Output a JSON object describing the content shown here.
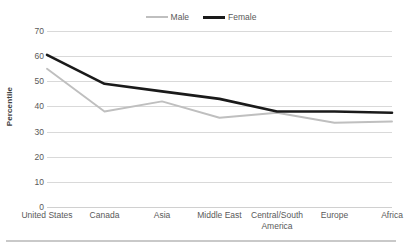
{
  "chart_data": {
    "type": "line",
    "title": "",
    "xlabel": "",
    "ylabel": "Percentile",
    "ylim": [
      0,
      70
    ],
    "yticks": [
      0,
      10,
      20,
      30,
      40,
      50,
      60,
      70
    ],
    "grid": true,
    "legend_position": "top-center",
    "categories": [
      "United States",
      "Canada",
      "Asia",
      "Middle East",
      "Central/South America",
      "Europe",
      "Africa"
    ],
    "series": [
      {
        "name": "Male",
        "color": "#bfbfbf",
        "values": [
          55,
          38,
          42,
          35.5,
          37.5,
          33.5,
          34
        ]
      },
      {
        "name": "Female",
        "color": "#1a1a1a",
        "values": [
          60.5,
          49,
          46,
          43,
          38,
          38,
          37.5
        ]
      }
    ]
  },
  "legend": {
    "entries": [
      {
        "label": "Male"
      },
      {
        "label": "Female"
      }
    ]
  },
  "axes": {
    "y_title": "Percentile",
    "y_tick_labels": [
      "70",
      "60",
      "50",
      "40",
      "30",
      "20",
      "10",
      "0"
    ],
    "x_tick_labels": [
      "United States",
      "Canada",
      "Asia",
      "Middle East",
      "Central/South America",
      "Europe",
      "Africa"
    ]
  },
  "colors": {
    "male_line": "#bfbfbf",
    "female_line": "#1a1a1a",
    "gridline": "#d9d9d9",
    "text": "#595959",
    "footer_rule": "#c9c9c9"
  }
}
